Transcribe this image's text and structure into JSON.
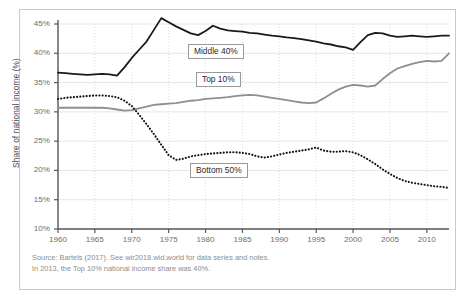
{
  "figure": {
    "background_color": "#ffffff",
    "frame_color": "#c9c9c9"
  },
  "axis": {
    "y_title": "Share of national income (%)",
    "y_ticks": [
      "45%",
      "40%",
      "35%",
      "30%",
      "25%",
      "20%",
      "15%",
      "10%"
    ],
    "x_ticks": [
      "1960",
      "1965",
      "1970",
      "1975",
      "1980",
      "1985",
      "1990",
      "1995",
      "2000",
      "2005",
      "2010"
    ]
  },
  "labels": {
    "middle": "Middle 40%",
    "top": "Top 10%",
    "bottom": "Bottom 50%"
  },
  "source": {
    "line1": "Source: Bartels (2017). See wir2018.wid.world for data series and notes.",
    "line2": "In 2013, the Top 10% national income share was 40%."
  },
  "chart_data": {
    "type": "line",
    "title": "",
    "xlabel": "",
    "ylabel": "Share of national income (%)",
    "xlim": [
      1960,
      2013
    ],
    "ylim": [
      10,
      45
    ],
    "ytick_values": [
      45,
      40,
      35,
      30,
      25,
      20,
      15,
      10
    ],
    "xtick_values": [
      1960,
      1965,
      1970,
      1975,
      1980,
      1985,
      1990,
      1995,
      2000,
      2005,
      2010
    ],
    "grid": true,
    "grid_axis": "both",
    "legend": "inline-annotations",
    "annotations": [
      {
        "text": "Middle 40%",
        "series": "Middle 40%"
      },
      {
        "text": "Top 10%",
        "series": "Top 10%"
      },
      {
        "text": "Bottom 50%",
        "series": "Bottom 50%"
      }
    ],
    "x": [
      1960,
      1961,
      1962,
      1963,
      1964,
      1965,
      1966,
      1967,
      1968,
      1969,
      1970,
      1971,
      1972,
      1973,
      1974,
      1975,
      1976,
      1977,
      1978,
      1979,
      1980,
      1981,
      1982,
      1983,
      1984,
      1985,
      1986,
      1987,
      1988,
      1989,
      1990,
      1991,
      1992,
      1993,
      1994,
      1995,
      1996,
      1997,
      1998,
      1999,
      2000,
      2001,
      2002,
      2003,
      2004,
      2005,
      2006,
      2007,
      2008,
      2009,
      2010,
      2011,
      2012,
      2013
    ],
    "series": [
      {
        "name": "Middle 40%",
        "color": "#1a1a1a",
        "style": "solid",
        "values": [
          36.7,
          36.6,
          36.5,
          36.4,
          36.3,
          36.4,
          36.5,
          36.4,
          36.2,
          37.6,
          39.2,
          40.6,
          42.0,
          44.0,
          46.0,
          45.3,
          44.6,
          44.0,
          43.4,
          43.1,
          43.8,
          44.7,
          44.2,
          43.9,
          43.8,
          43.7,
          43.5,
          43.4,
          43.2,
          43.0,
          42.9,
          42.7,
          42.6,
          42.4,
          42.2,
          42.0,
          41.7,
          41.5,
          41.2,
          41.0,
          40.6,
          41.9,
          43.1,
          43.5,
          43.4,
          43.0,
          42.8,
          42.9,
          43.0,
          42.9,
          42.8,
          42.9,
          43.0,
          43.0
        ]
      },
      {
        "name": "Top 10%",
        "color": "#8f8f8f",
        "style": "solid",
        "values": [
          30.7,
          30.7,
          30.7,
          30.7,
          30.7,
          30.7,
          30.7,
          30.6,
          30.4,
          30.2,
          30.3,
          30.6,
          30.9,
          31.2,
          31.3,
          31.4,
          31.5,
          31.7,
          31.9,
          32.0,
          32.2,
          32.3,
          32.4,
          32.5,
          32.7,
          32.8,
          32.9,
          32.8,
          32.6,
          32.4,
          32.2,
          32.0,
          31.8,
          31.6,
          31.5,
          31.6,
          32.3,
          33.1,
          33.8,
          34.3,
          34.6,
          34.5,
          34.3,
          34.5,
          35.6,
          36.6,
          37.4,
          37.8,
          38.2,
          38.5,
          38.7,
          38.6,
          38.7,
          40.0
        ]
      },
      {
        "name": "Bottom 50%",
        "color": "#111111",
        "style": "dotted",
        "values": [
          32.2,
          32.4,
          32.5,
          32.6,
          32.7,
          32.8,
          32.8,
          32.7,
          32.5,
          31.9,
          31.0,
          29.5,
          27.9,
          26.2,
          24.4,
          22.6,
          21.8,
          22.0,
          22.4,
          22.6,
          22.8,
          22.9,
          23.0,
          23.1,
          23.1,
          23.0,
          22.8,
          22.4,
          22.2,
          22.4,
          22.7,
          23.0,
          23.2,
          23.4,
          23.6,
          23.9,
          23.4,
          23.2,
          23.2,
          23.3,
          23.1,
          22.6,
          21.9,
          21.1,
          20.2,
          19.4,
          18.7,
          18.2,
          17.9,
          17.7,
          17.5,
          17.3,
          17.2,
          17.0
        ]
      }
    ]
  }
}
